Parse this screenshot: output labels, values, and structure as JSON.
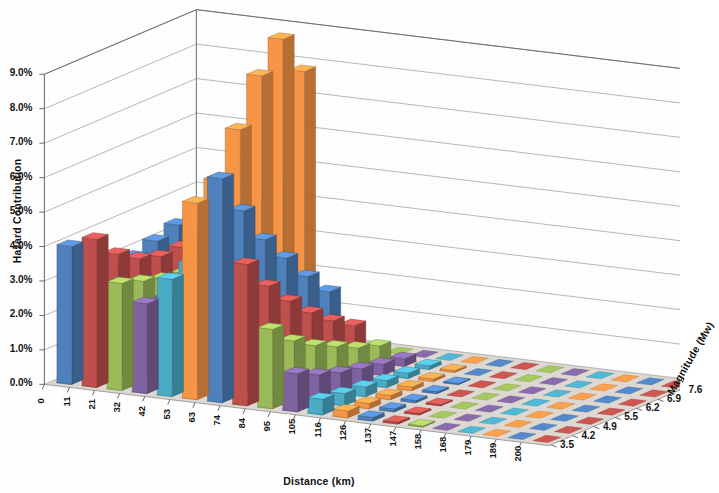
{
  "chart_data": {
    "type": "bar",
    "title": "",
    "subtitle": "",
    "xlabel": "Distance (km)",
    "ylabel": "Hazard Contribution",
    "zlabel": "Magnitude (Mw)",
    "projection": "3d-column",
    "grid": true,
    "legend": "none",
    "ylim": [
      0,
      9.0
    ],
    "ytick_labels": [
      "0.0%",
      "1.0%",
      "2.0%",
      "3.0%",
      "4.0%",
      "5.0%",
      "6.0%",
      "7.0%",
      "8.0%",
      "9.0%"
    ],
    "ytick_values": [
      0,
      1,
      2,
      3,
      4,
      5,
      6,
      7,
      8,
      9
    ],
    "xtick_labels": [
      "0",
      "11",
      "21",
      "32",
      "42",
      "53",
      "63",
      "74",
      "84",
      "95",
      "105",
      "116",
      "126",
      "137",
      "147",
      "158",
      "168",
      "179",
      "189",
      "200"
    ],
    "categories": [
      "0",
      "11",
      "21",
      "32",
      "42",
      "53",
      "63",
      "74",
      "84",
      "95",
      "105",
      "116",
      "126",
      "137",
      "147",
      "158",
      "168",
      "179",
      "189",
      "200"
    ],
    "ztick_labels": [
      "3.5",
      "4.2",
      "4.9",
      "5.5",
      "6.2",
      "6.9",
      "7.6"
    ],
    "series_colors": [
      "#4F81BD",
      "#C0504D",
      "#9BBB59",
      "#8064A2",
      "#4BACC6",
      "#F79646"
    ],
    "series": [
      {
        "name": "3.5",
        "color": "#4F81BD",
        "values": [
          4.0,
          4.3,
          3.1,
          2.6,
          3.4,
          5.7,
          6.5,
          4.1,
          2.3,
          1.1,
          0.45,
          0.2,
          0.1,
          0.05,
          0.03,
          0.02,
          0.01,
          0.01,
          0.0,
          0.0
        ]
      },
      {
        "name": "4.2",
        "color": "#C0504D",
        "values": [
          3.3,
          3.6,
          2.9,
          2.5,
          3.6,
          6.1,
          5.3,
          3.2,
          1.7,
          0.8,
          0.35,
          0.15,
          0.08,
          0.04,
          0.02,
          0.01,
          0.01,
          0.0,
          0.0,
          0.0
        ]
      },
      {
        "name": "4.9",
        "color": "#9BBB59",
        "values": [
          3.0,
          3.2,
          2.7,
          2.4,
          3.9,
          7.3,
          4.2,
          2.5,
          1.3,
          0.6,
          0.28,
          0.12,
          0.06,
          0.03,
          0.02,
          0.01,
          0.0,
          0.0,
          0.0,
          0.0
        ]
      },
      {
        "name": "5.5",
        "color": "#8064A2",
        "values": [
          2.9,
          3.0,
          2.6,
          2.4,
          4.2,
          8.6,
          3.4,
          1.9,
          1.0,
          0.45,
          0.2,
          0.1,
          0.05,
          0.02,
          0.01,
          0.01,
          0.0,
          0.0,
          0.0,
          0.0
        ]
      },
      {
        "name": "6.2",
        "color": "#4BACC6",
        "values": [
          3.1,
          3.0,
          2.6,
          2.5,
          4.6,
          9.4,
          2.6,
          1.4,
          0.7,
          0.32,
          0.15,
          0.07,
          0.03,
          0.02,
          0.01,
          0.0,
          0.0,
          0.0,
          0.0,
          0.0
        ]
      },
      {
        "name": "6.9",
        "color": "#F79646",
        "values": [
          3.3,
          3.1,
          2.7,
          2.7,
          5.0,
          8.2,
          1.9,
          1.0,
          0.5,
          0.22,
          0.1,
          0.05,
          0.02,
          0.01,
          0.0,
          0.0,
          0.0,
          0.0,
          0.0,
          0.0
        ]
      },
      {
        "name": "7.6",
        "color": "#4F81BD",
        "values": [
          0.0,
          0.0,
          0.0,
          0.0,
          0.0,
          0.0,
          0.0,
          0.0,
          0.0,
          0.0,
          0.0,
          0.0,
          0.0,
          0.0,
          0.0,
          0.0,
          0.0,
          0.0,
          0.0,
          0.0
        ]
      }
    ]
  },
  "axes": {
    "y": {
      "title": "Hazard Contribution",
      "ticks": [
        "9.0%",
        "8.0%",
        "7.0%",
        "6.0%",
        "5.0%",
        "4.0%",
        "3.0%",
        "2.0%",
        "1.0%",
        "0.0%"
      ]
    },
    "x": {
      "title": "Distance (km)",
      "ticks": [
        "0",
        "11",
        "21",
        "32",
        "42",
        "53",
        "63",
        "74",
        "84",
        "95",
        "105",
        "116",
        "126",
        "137",
        "147",
        "158",
        "168",
        "179",
        "189",
        "200"
      ]
    },
    "z": {
      "title": "Magnitude (Mw)",
      "ticks": [
        "7.6",
        "6.9",
        "6.2",
        "5.5",
        "4.9",
        "4.2",
        "3.5"
      ]
    }
  },
  "palette": {
    "blue": "#4F81BD",
    "red": "#C0504D",
    "green": "#9BBB59",
    "purple": "#8064A2",
    "cyan": "#4BACC6",
    "orange": "#F79646",
    "wall": "#FFFFFF",
    "floor": "#DEDAD3",
    "gridline": "#9A9A9A",
    "text": "#141414"
  }
}
